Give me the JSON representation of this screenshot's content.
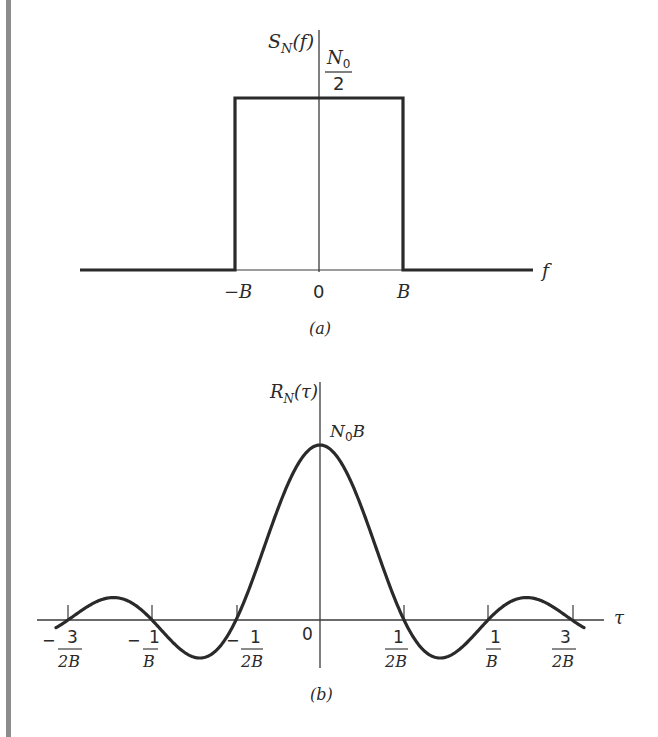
{
  "figure_a": {
    "y_label": "S",
    "y_label_sub": "N",
    "y_label_arg": "(f)",
    "level_num": "N",
    "level_num_sub": "0",
    "level_den": "2",
    "x_axis_label": "f",
    "ticks": {
      "neg_b": "−B",
      "zero": "0",
      "pos_b": "B"
    },
    "caption": "(a)"
  },
  "figure_b": {
    "y_label": "R",
    "y_label_sub": "N",
    "y_label_arg": "(τ)",
    "peak_label": "N",
    "peak_label_sub": "0",
    "peak_label_tail": "B",
    "x_axis_label": "τ",
    "ticks": [
      {
        "sign": "−",
        "num": "3",
        "den": "2B"
      },
      {
        "sign": "−",
        "num": "1",
        "den": "B"
      },
      {
        "sign": "−",
        "num": "1",
        "den": "2B"
      },
      {
        "sign": "",
        "num": "0",
        "den": ""
      },
      {
        "sign": "",
        "num": "1",
        "den": "2B"
      },
      {
        "sign": "",
        "num": "1",
        "den": "B"
      },
      {
        "sign": "",
        "num": "3",
        "den": "2B"
      }
    ],
    "caption": "(b)"
  },
  "chart_data": [
    {
      "type": "line",
      "title": "(a) Power spectral density of bandlimited white noise",
      "xlabel": "f",
      "ylabel": "S_N(f)",
      "x": [
        "-inf",
        "-B",
        "-B",
        "B",
        "B",
        "+inf"
      ],
      "values": [
        0,
        0,
        "N0/2",
        "N0/2",
        0,
        0
      ],
      "annotations": [
        "N0/2",
        "-B",
        "0",
        "B"
      ]
    },
    {
      "type": "line",
      "title": "(b) Autocorrelation function",
      "xlabel": "τ",
      "ylabel": "R_N(τ)",
      "function": "R_N(τ) = N0 B sinc(2Bτ)",
      "x_ticks": [
        "-3/(2B)",
        "-1/B",
        "-1/(2B)",
        "0",
        "1/(2B)",
        "1/B",
        "3/(2B)"
      ],
      "zero_crossings": [
        "-3/(2B)",
        "-1/B",
        "-1/(2B)",
        "1/(2B)",
        "1/B",
        "3/(2B)"
      ],
      "peak": {
        "x": 0,
        "y": "N0 B"
      },
      "annotations": [
        "N0B"
      ]
    }
  ]
}
